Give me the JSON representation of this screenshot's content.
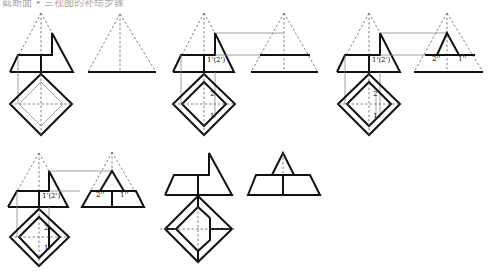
{
  "caption": "截断面 • 三视图的补绘步骤",
  "panels": [
    {
      "id": "step-1",
      "labels": {}
    },
    {
      "id": "step-2",
      "labels": {
        "front_point": "1'(2')",
        "top_point_2": "2",
        "top_point_1": "1"
      }
    },
    {
      "id": "step-3",
      "labels": {
        "front_point": "1'(2')",
        "top_point_2": "2",
        "top_point_1": "1",
        "side_point_2": "2''",
        "side_point_1": "1''"
      }
    },
    {
      "id": "step-4",
      "labels": {
        "front_point": "1'(2')",
        "top_point_2": "2",
        "top_point_1": "1",
        "side_point_2": "2''",
        "side_point_1": "1''"
      }
    },
    {
      "id": "step-5-result",
      "labels": {}
    }
  ],
  "colors": {
    "outline": "#111111",
    "hidden": "#666666",
    "projection": "#888888"
  }
}
